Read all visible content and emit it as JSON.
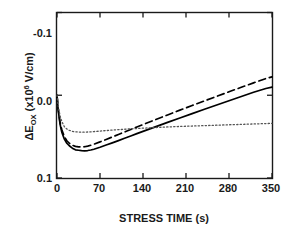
{
  "chart_data": {
    "type": "line",
    "title": "",
    "xlabel": "STRESS TIME (s)",
    "ylabel_parts": {
      "delta_e": "ΔE",
      "sub": "OX",
      "mid": " (x10",
      "sup": "6",
      "tail": " V/cm)"
    },
    "ylabel_plain": "ΔE_OX (x10^6 V/cm)",
    "xlim": [
      0,
      350
    ],
    "ylim": [
      -0.1,
      0.1
    ],
    "y_inverted": true,
    "grid": false,
    "legend": "none",
    "xticks": [
      "0",
      "70",
      "140",
      "210",
      "280",
      "350"
    ],
    "xtick_values": [
      0,
      70,
      140,
      210,
      280,
      350
    ],
    "yticks": [
      "-0.1",
      "0.0",
      "0.1"
    ],
    "ytick_values": [
      -0.1,
      0.0,
      0.1
    ],
    "series": [
      {
        "name": "solid",
        "style": "solid",
        "color": "#000000",
        "x": [
          0,
          2,
          5,
          8,
          12,
          16,
          20,
          25,
          30,
          35,
          40,
          45,
          50,
          55,
          60,
          70,
          80,
          90,
          100,
          110,
          120,
          130,
          140,
          160,
          180,
          200,
          220,
          240,
          260,
          280,
          300,
          320,
          340,
          350
        ],
        "y": [
          0.0,
          0.018,
          0.035,
          0.045,
          0.053,
          0.058,
          0.061,
          0.064,
          0.066,
          0.0665,
          0.067,
          0.0672,
          0.0668,
          0.0662,
          0.0652,
          0.0628,
          0.0602,
          0.0575,
          0.0548,
          0.052,
          0.0492,
          0.0464,
          0.0436,
          0.0382,
          0.0328,
          0.0275,
          0.0222,
          0.017,
          0.0118,
          0.0066,
          0.0015,
          -0.0036,
          -0.0082,
          -0.0098
        ]
      },
      {
        "name": "dashed",
        "style": "dashed",
        "color": "#000000",
        "x": [
          0,
          2,
          5,
          8,
          12,
          16,
          20,
          25,
          30,
          35,
          40,
          45,
          50,
          55,
          60,
          70,
          80,
          90,
          100,
          110,
          120,
          130,
          140,
          160,
          180,
          200,
          220,
          240,
          260,
          280,
          300,
          320,
          340,
          350
        ],
        "y": [
          0.0,
          0.017,
          0.033,
          0.042,
          0.05,
          0.055,
          0.058,
          0.0605,
          0.0618,
          0.0624,
          0.0625,
          0.0622,
          0.0614,
          0.0604,
          0.0592,
          0.0564,
          0.0534,
          0.0504,
          0.0474,
          0.0444,
          0.0414,
          0.0384,
          0.0354,
          0.0296,
          0.0238,
          0.018,
          0.0124,
          0.0068,
          0.0013,
          -0.0042,
          -0.0096,
          -0.015,
          -0.0202,
          -0.0222
        ]
      },
      {
        "name": "dotted",
        "style": "dotted",
        "color": "#555555",
        "x": [
          0,
          2,
          5,
          8,
          12,
          16,
          20,
          25,
          30,
          35,
          40,
          45,
          50,
          55,
          60,
          70,
          80,
          90,
          100,
          110,
          120,
          140,
          160,
          180,
          200,
          220,
          240,
          260,
          280,
          300,
          320,
          340,
          350
        ],
        "y": [
          0.0,
          0.013,
          0.025,
          0.032,
          0.038,
          0.0408,
          0.0424,
          0.0436,
          0.0442,
          0.0445,
          0.0446,
          0.0446,
          0.0444,
          0.0442,
          0.0439,
          0.0433,
          0.0427,
          0.0421,
          0.0416,
          0.0411,
          0.0406,
          0.0398,
          0.039,
          0.0383,
          0.0377,
          0.0372,
          0.0367,
          0.0362,
          0.0357,
          0.0352,
          0.0347,
          0.0342,
          0.034
        ]
      }
    ]
  },
  "axes": {
    "frame_color": "#1a1a1a"
  }
}
